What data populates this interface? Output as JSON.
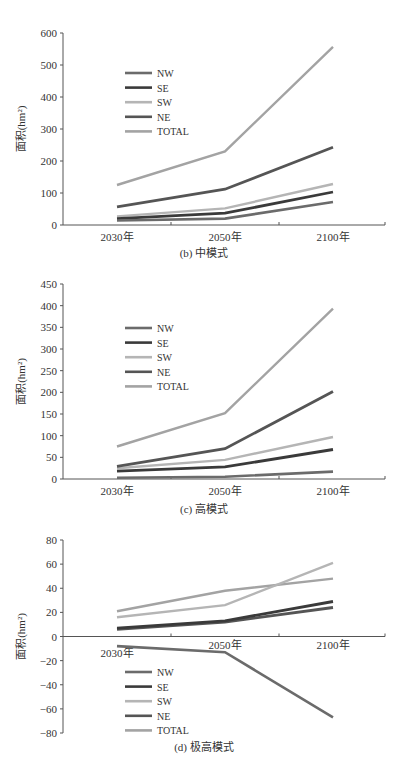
{
  "colors": {
    "NW": "#6b6b6b",
    "SE": "#3a3a3a",
    "SW": "#b5b5b5",
    "NE": "#555555",
    "TOTAL": "#a3a3a3",
    "axis": "#555555"
  },
  "legend": [
    "NW",
    "SE",
    "SW",
    "NE",
    "TOTAL"
  ],
  "chart_data": [
    {
      "type": "line",
      "title": "(b) 中模式",
      "xlabel": "",
      "ylabel": "面积(hm²)",
      "categories": [
        "2030年",
        "2050年",
        "2100年"
      ],
      "ylim": [
        0,
        600
      ],
      "yticks": [
        0,
        100,
        200,
        300,
        400,
        500,
        600
      ],
      "grid": false,
      "legend_position": "upper-left inside",
      "series": [
        {
          "name": "NW",
          "values": [
            14,
            20,
            72
          ]
        },
        {
          "name": "SE",
          "values": [
            20,
            37,
            103
          ]
        },
        {
          "name": "SW",
          "values": [
            27,
            52,
            128
          ]
        },
        {
          "name": "NE",
          "values": [
            57,
            112,
            243
          ]
        },
        {
          "name": "TOTAL",
          "values": [
            125,
            230,
            557
          ]
        }
      ]
    },
    {
      "type": "line",
      "title": "(c) 高模式",
      "xlabel": "",
      "ylabel": "面积(hm²)",
      "categories": [
        "2030年",
        "2050年",
        "2100年"
      ],
      "ylim": [
        0,
        450
      ],
      "yticks": [
        0,
        50,
        100,
        150,
        200,
        250,
        300,
        350,
        400,
        450
      ],
      "grid": false,
      "legend_position": "upper-left inside",
      "series": [
        {
          "name": "NW",
          "values": [
            3,
            5,
            17
          ]
        },
        {
          "name": "SE",
          "values": [
            18,
            28,
            68
          ]
        },
        {
          "name": "SW",
          "values": [
            25,
            44,
            97
          ]
        },
        {
          "name": "NE",
          "values": [
            29,
            70,
            202
          ]
        },
        {
          "name": "TOTAL",
          "values": [
            75,
            152,
            393
          ]
        }
      ]
    },
    {
      "type": "line",
      "title": "(d) 极高模式",
      "xlabel": "",
      "ylabel": "面积(hm²)",
      "categories": [
        "2030年",
        "2050年",
        "2100年"
      ],
      "ylim": [
        -80,
        80
      ],
      "yticks": [
        -80,
        -60,
        -40,
        -20,
        0,
        20,
        40,
        60,
        80
      ],
      "grid": false,
      "legend_position": "lower-left inside",
      "series": [
        {
          "name": "NW",
          "values": [
            -8,
            -13,
            -67
          ]
        },
        {
          "name": "SE",
          "values": [
            7,
            13,
            29
          ]
        },
        {
          "name": "SW",
          "values": [
            16,
            26,
            61
          ]
        },
        {
          "name": "NE",
          "values": [
            6,
            12,
            24
          ]
        },
        {
          "name": "TOTAL",
          "values": [
            21,
            38,
            48
          ]
        }
      ]
    }
  ]
}
